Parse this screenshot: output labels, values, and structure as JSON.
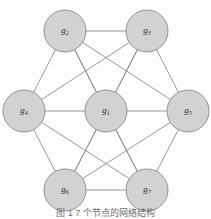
{
  "figure": {
    "type": "graph-diagram",
    "background_color": "#fdfdfd",
    "node_fill": "#d2d2d2",
    "node_stroke": "#8a8a8a",
    "edge_color": "#8d8d8d",
    "caption": "图 1   7 个节点的网络结构"
  },
  "chart_data": {
    "type": "diagram",
    "title": "",
    "nodes": [
      {
        "id": "g1",
        "label": "g",
        "sub": "1",
        "x": 106,
        "y": 111,
        "r": 21
      },
      {
        "id": "g2",
        "label": "g",
        "sub": "2",
        "x": 65,
        "y": 31,
        "r": 21
      },
      {
        "id": "g3",
        "label": "g",
        "sub": "3",
        "x": 147,
        "y": 31,
        "r": 21
      },
      {
        "id": "g4",
        "label": "g",
        "sub": "4",
        "x": 24,
        "y": 111,
        "r": 21
      },
      {
        "id": "g5",
        "label": "g",
        "sub": "5",
        "x": 188,
        "y": 111,
        "r": 21
      },
      {
        "id": "g6",
        "label": "g",
        "sub": "6",
        "x": 65,
        "y": 190,
        "r": 21
      },
      {
        "id": "g7",
        "label": "g",
        "sub": "7",
        "x": 147,
        "y": 190,
        "r": 21
      }
    ],
    "edges": [
      [
        "g1",
        "g2"
      ],
      [
        "g1",
        "g3"
      ],
      [
        "g1",
        "g4"
      ],
      [
        "g1",
        "g5"
      ],
      [
        "g1",
        "g6"
      ],
      [
        "g1",
        "g7"
      ],
      [
        "g2",
        "g3"
      ],
      [
        "g3",
        "g5"
      ],
      [
        "g5",
        "g7"
      ],
      [
        "g7",
        "g6"
      ],
      [
        "g6",
        "g4"
      ],
      [
        "g4",
        "g2"
      ],
      [
        "g2",
        "g5"
      ],
      [
        "g2",
        "g7"
      ],
      [
        "g3",
        "g4"
      ],
      [
        "g3",
        "g6"
      ],
      [
        "g4",
        "g7"
      ],
      [
        "g5",
        "g6"
      ]
    ]
  }
}
